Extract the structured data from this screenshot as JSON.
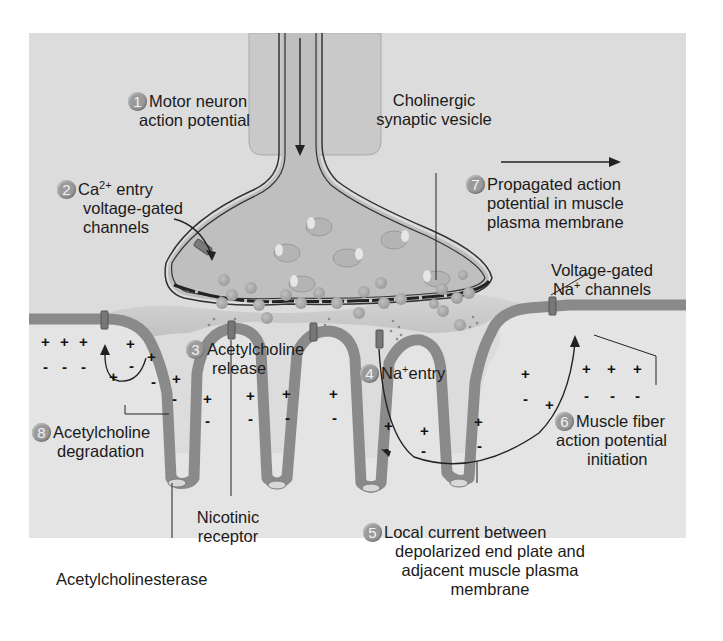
{
  "figure": {
    "colors": {
      "background": "#dcdcdc",
      "axon_fill": "#c4c4c4",
      "terminal_fill": "#bdbdbd",
      "muscle_membrane": "#8a8a8a",
      "muscle_cytoplasm": "#e8e8e8",
      "vesicle": "#a8a8a8",
      "step_badge": "#9a9a9a",
      "text": "#1a1a1a"
    }
  },
  "steps": [
    {
      "num": "1",
      "line1": "Motor neuron",
      "line2": "action potential"
    },
    {
      "num": "2",
      "line1_pre": "Ca",
      "line1_sup": "2+",
      "line1_post": " entry",
      "line2": "voltage-gated",
      "line3": "channels"
    },
    {
      "num": "3",
      "line1": "Acetylcholine",
      "line2": "release"
    },
    {
      "num": "4",
      "line1_pre": "Na",
      "line1_sup": "+",
      "line1_post": "entry"
    },
    {
      "num": "5",
      "line1": "Local current between",
      "line2": "depolarized end plate and",
      "line3": "adjacent muscle plasma",
      "line4": "membrane"
    },
    {
      "num": "6",
      "line1": "Muscle fiber",
      "line2": "action potential",
      "line3": "initiation"
    },
    {
      "num": "7",
      "line1": "Propagated action",
      "line2": "potential in muscle",
      "line3": "plasma membrane"
    },
    {
      "num": "8",
      "line1": "Acetylcholine",
      "line2": "degradation"
    }
  ],
  "labels": {
    "vesicle": {
      "line1": "Cholinergic",
      "line2": "synaptic vesicle"
    },
    "na_channels": {
      "line1": "Voltage-gated",
      "line2_pre": "Na",
      "line2_sup": "+",
      "line2_post": " channels"
    },
    "nicotinic": {
      "line1": "Nicotinic",
      "line2": "receptor"
    },
    "acetylcholinesterase": "Acetylcholinesterase"
  },
  "charges": {
    "plus": "+",
    "minus": "-"
  }
}
